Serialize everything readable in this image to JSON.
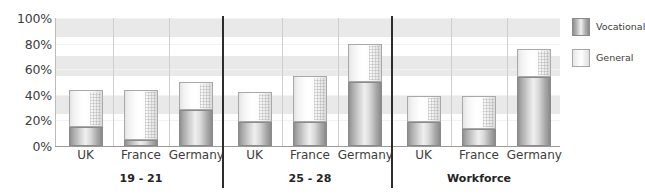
{
  "chart_data": {
    "type": "bar",
    "stacked": true,
    "title": "",
    "xlabel": "",
    "ylabel": "",
    "ylim": [
      0,
      100
    ],
    "yticks": [
      "0%",
      "20%",
      "40%",
      "60%",
      "80%",
      "100%"
    ],
    "ytick_values": [
      0,
      20,
      40,
      60,
      80,
      100
    ],
    "grid": true,
    "legend_position": "right",
    "categories": [
      "UK",
      "France",
      "Germany",
      "UK",
      "France",
      "Germany",
      "UK",
      "France",
      "Germany"
    ],
    "groups": [
      {
        "label": "19 - 21",
        "categories": [
          "UK",
          "France",
          "Germany"
        ]
      },
      {
        "label": "25 - 28",
        "categories": [
          "UK",
          "France",
          "Germany"
        ]
      },
      {
        "label": "Workforce",
        "categories": [
          "UK",
          "France",
          "Germany"
        ]
      }
    ],
    "series": [
      {
        "name": "Vocational",
        "color": "#9a9a9a",
        "values": [
          15,
          5,
          28,
          19,
          19,
          50,
          19,
          13,
          54
        ]
      },
      {
        "name": "General",
        "color": "#f5f5f5",
        "values": [
          29,
          39,
          22,
          23,
          36,
          30,
          20,
          26,
          22
        ]
      }
    ],
    "totals": [
      44,
      44,
      50,
      42,
      55,
      80,
      39,
      39,
      76
    ],
    "bars": [
      {
        "group": "19 - 21",
        "category": "UK",
        "vocational": 15,
        "general": 29,
        "total": 44
      },
      {
        "group": "19 - 21",
        "category": "France",
        "vocational": 5,
        "general": 39,
        "total": 44
      },
      {
        "group": "19 - 21",
        "category": "Germany",
        "vocational": 28,
        "general": 22,
        "total": 50
      },
      {
        "group": "25 - 28",
        "category": "UK",
        "vocational": 19,
        "general": 23,
        "total": 42
      },
      {
        "group": "25 - 28",
        "category": "France",
        "vocational": 19,
        "general": 36,
        "total": 55
      },
      {
        "group": "25 - 28",
        "category": "Germany",
        "vocational": 50,
        "general": 30,
        "total": 80
      },
      {
        "group": "Workforce",
        "category": "UK",
        "vocational": 19,
        "general": 20,
        "total": 39
      },
      {
        "group": "Workforce",
        "category": "France",
        "vocational": 13,
        "general": 26,
        "total": 39
      },
      {
        "group": "Workforce",
        "category": "Germany",
        "vocational": 54,
        "general": 22,
        "total": 76
      }
    ]
  },
  "legend": {
    "items": [
      {
        "label": "Vocational",
        "swatch": "vocational-swatch"
      },
      {
        "label": "General",
        "swatch": "general-swatch"
      }
    ]
  },
  "axis": {
    "y_labels": [
      "100%",
      "80%",
      "60%",
      "40%",
      "20%",
      "0%"
    ]
  }
}
